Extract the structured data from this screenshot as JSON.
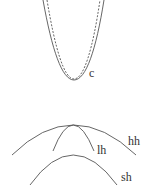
{
  "diagram": {
    "curves": [
      {
        "id": "c-solid",
        "style": "solid",
        "label": "c"
      },
      {
        "id": "c-dashed",
        "style": "dashed",
        "label": ""
      },
      {
        "id": "hh",
        "style": "solid",
        "label": "hh"
      },
      {
        "id": "lh",
        "style": "solid",
        "label": "lh"
      },
      {
        "id": "sh",
        "style": "solid",
        "label": "sh"
      }
    ],
    "labels": {
      "c": "c",
      "hh": "hh",
      "lh": "lh",
      "sh": "sh"
    },
    "colors": {
      "line": "#555555",
      "text": "#333333",
      "background": "#ffffff"
    }
  }
}
